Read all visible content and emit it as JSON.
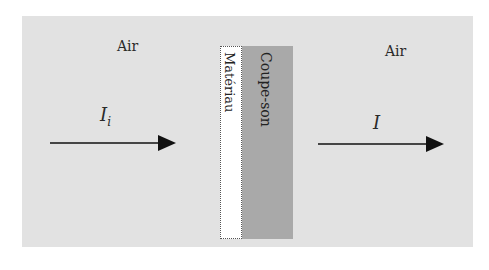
{
  "diagram": {
    "left_medium": {
      "label": "Air"
    },
    "right_medium": {
      "label": "Air"
    },
    "incident_intensity": {
      "symbol": "I",
      "subscript": "i"
    },
    "transmitted_intensity": {
      "symbol": "I"
    },
    "layers": [
      {
        "label": "Matériau",
        "fill": "#ffffff",
        "border": "dotted"
      },
      {
        "label": "Coupe-son",
        "fill": "#a9a9a9"
      }
    ],
    "colors": {
      "background": "#e2e2e2",
      "arrow": "#111111"
    }
  }
}
